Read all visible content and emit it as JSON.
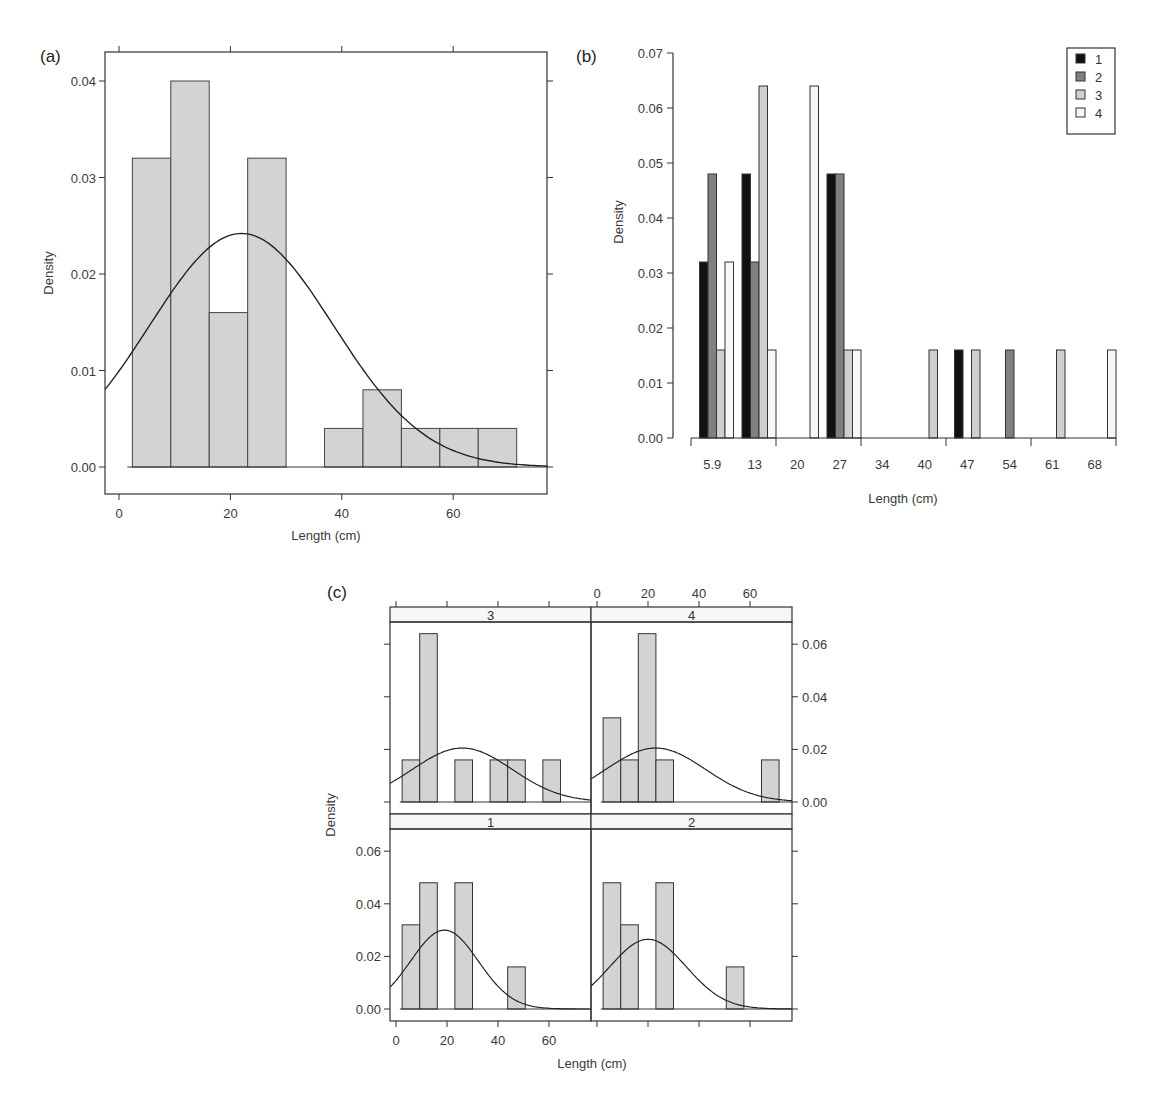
{
  "chart_data": [
    {
      "id": "a",
      "panel_label": "(a)",
      "type": "bar",
      "subtype": "histogram_with_normal_curve",
      "xlabel": "Length (cm)",
      "ylabel": "Density",
      "xlim": [
        -2.5,
        77
      ],
      "ylim": [
        -0.0028,
        0.0428
      ],
      "xticks": [
        0,
        20,
        40,
        60
      ],
      "yticks": [
        "0.00",
        "0.01",
        "0.02",
        "0.03",
        "0.04"
      ],
      "bin_edges": [
        2.4,
        9.3,
        16.2,
        23.1,
        30.0,
        36.9,
        43.8,
        50.7,
        57.6,
        64.5,
        71.4
      ],
      "values": [
        0.032,
        0.04,
        0.016,
        0.032,
        0.0,
        0.004,
        0.008,
        0.004,
        0.004,
        0.004
      ],
      "curve": {
        "kind": "normal",
        "mean": 22,
        "sd": 16.5,
        "peak": 0.0242
      },
      "bar_color": "#d3d3d3"
    },
    {
      "id": "b",
      "panel_label": "(b)",
      "type": "bar",
      "subtype": "grouped",
      "xlabel": "Length (cm)",
      "ylabel": "Density",
      "ylim": [
        0,
        0.07
      ],
      "yticks": [
        "0.00",
        "0.01",
        "0.02",
        "0.03",
        "0.04",
        "0.05",
        "0.06",
        "0.07"
      ],
      "categories": [
        "5.9",
        "13",
        "20",
        "27",
        "34",
        "40",
        "47",
        "54",
        "61",
        "68"
      ],
      "series": [
        {
          "name": "1",
          "color": "#111111",
          "values": [
            0.032,
            0.048,
            0,
            0.048,
            0,
            0,
            0.016,
            0,
            0,
            0
          ]
        },
        {
          "name": "2",
          "color": "#808080",
          "values": [
            0.048,
            0.032,
            0,
            0.048,
            0,
            0,
            0,
            0.016,
            0,
            0
          ]
        },
        {
          "name": "3",
          "color": "#cfcfcf",
          "values": [
            0.016,
            0.064,
            0,
            0.016,
            0,
            0.016,
            0.016,
            0,
            0.016,
            0
          ]
        },
        {
          "name": "4",
          "color": "#f7f7f7",
          "values": [
            0.032,
            0.016,
            0.064,
            0.016,
            0,
            0,
            0,
            0,
            0,
            0.016
          ]
        }
      ],
      "legend": {
        "position": "top-right",
        "entries": [
          "1",
          "2",
          "3",
          "4"
        ]
      }
    },
    {
      "id": "c",
      "panel_label": "(c)",
      "type": "bar",
      "subtype": "faceted_histogram_with_normal_curve",
      "xlabel": "Length (cm)",
      "ylabel": "Density",
      "xlim": [
        -2.5,
        76
      ],
      "ylim": [
        -0.0045,
        0.069
      ],
      "xticks": [
        0,
        20,
        40,
        60
      ],
      "yticks": [
        "0.00",
        "0.02",
        "0.04",
        "0.06"
      ],
      "bin_edges": [
        2.4,
        9.3,
        16.2,
        23.1,
        30.0,
        36.9,
        43.8,
        50.7,
        57.6,
        64.5,
        71.4
      ],
      "panels": [
        {
          "strip": "3",
          "values": [
            0.016,
            0.064,
            0,
            0.016,
            0,
            0.016,
            0.016,
            0,
            0.016,
            0
          ],
          "curve": {
            "mean": 26,
            "sd": 19.5,
            "peak": 0.0205
          }
        },
        {
          "strip": "4",
          "values": [
            0.032,
            0.016,
            0.064,
            0.016,
            0,
            0,
            0,
            0,
            0,
            0.016
          ],
          "curve": {
            "mean": 23,
            "sd": 19.5,
            "peak": 0.0205
          }
        },
        {
          "strip": "1",
          "values": [
            0.032,
            0.048,
            0,
            0.048,
            0,
            0,
            0.016,
            0,
            0,
            0
          ],
          "curve": {
            "mean": 19,
            "sd": 13.3,
            "peak": 0.03
          }
        },
        {
          "strip": "2",
          "values": [
            0.048,
            0.032,
            0,
            0.048,
            0,
            0,
            0,
            0.016,
            0,
            0
          ],
          "curve": {
            "mean": 20,
            "sd": 15,
            "peak": 0.0265
          }
        }
      ]
    }
  ],
  "labels": {
    "a_panel": "(a)",
    "b_panel": "(b)",
    "c_panel": "(c)",
    "a_xlabel": "Length (cm)",
    "a_ylabel": "Density",
    "b_xlabel": "Length (cm)",
    "b_ylabel": "Density",
    "c_xlabel": "Length (cm)",
    "c_ylabel": "Density"
  }
}
